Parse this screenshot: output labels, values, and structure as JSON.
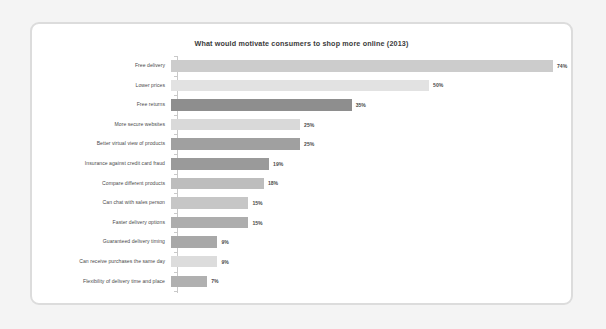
{
  "card": {
    "background": "#ffffff",
    "border_color": "#dcdcdc",
    "page_background": "#f4f4f4"
  },
  "chart_data": {
    "type": "bar",
    "orientation": "horizontal",
    "title": "What would motivate consumers to shop more online (2013)",
    "xlabel": "",
    "ylabel": "",
    "xlim": [
      0,
      74
    ],
    "grid": false,
    "legend": false,
    "value_suffix": "%",
    "categories": [
      "Free delivery",
      "Lower prices",
      "Free returns",
      "More secure websites",
      "Better virtual view of products",
      "Insurance against credit card fraud",
      "Compare different products",
      "Can chat with sales person",
      "Faster delivery options",
      "Guaranteed delivery timing",
      "Can receive purchases the same day",
      "Flexibility of delivery time and place"
    ],
    "values": [
      74,
      50,
      35,
      25,
      25,
      19,
      18,
      15,
      15,
      9,
      9,
      7
    ],
    "value_labels": [
      "74%",
      "50%",
      "35%",
      "25%",
      "25%",
      "19%",
      "18%",
      "15%",
      "15%",
      "9%",
      "9%",
      "7%"
    ],
    "bar_colors": [
      "#cccccc",
      "#e2e2e2",
      "#8e8e8e",
      "#d9d9d9",
      "#a0a0a0",
      "#9a9a9a",
      "#bdbdbd",
      "#c6c6c6",
      "#adadad",
      "#a8a8a8",
      "#dcdcdc",
      "#b0b0b0"
    ]
  }
}
